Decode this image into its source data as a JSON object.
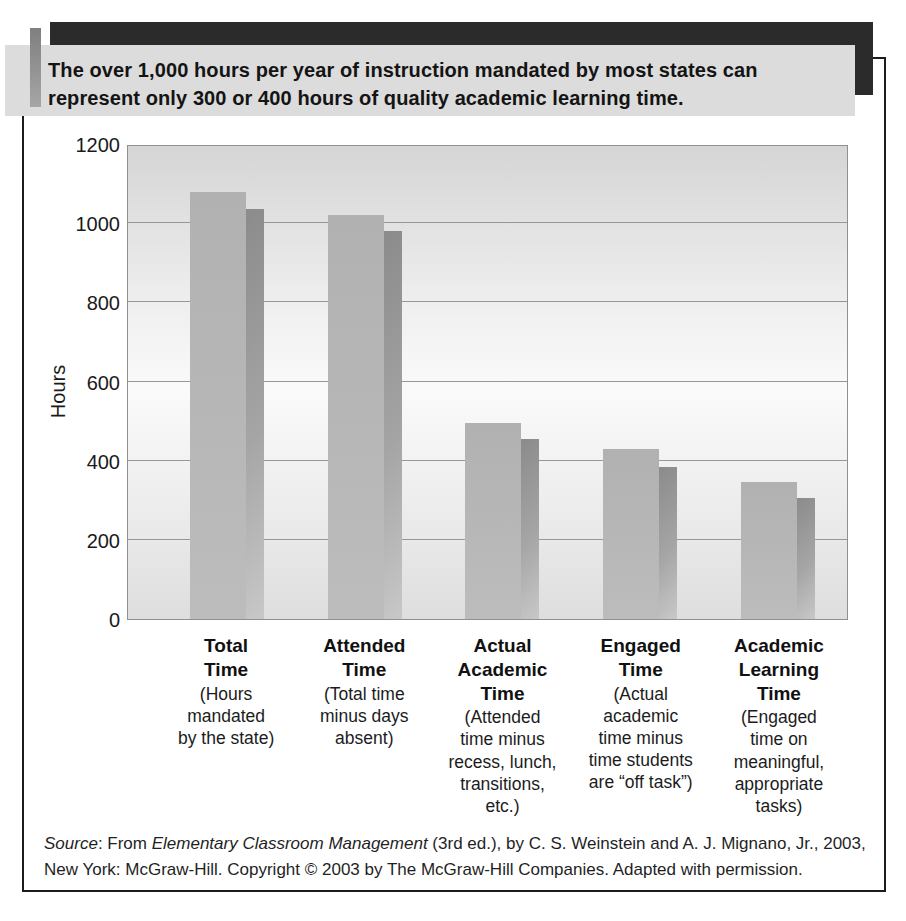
{
  "header": {
    "caption": "The over 1,000 hours per year of instruction mandated by most states can\nrepresent only 300 or 400 hours of quality academic learning time."
  },
  "chart_data": {
    "type": "bar",
    "title": "",
    "xlabel": "",
    "ylabel": "Hours",
    "ylim": [
      0,
      1200
    ],
    "yticks": [
      0,
      200,
      400,
      600,
      800,
      1000,
      1200
    ],
    "grid": true,
    "legend": false,
    "categories": [
      "Total Time",
      "Attended Time",
      "Actual Academic Time",
      "Engaged Time",
      "Academic Learning Time"
    ],
    "values": [
      1080,
      1020,
      495,
      430,
      345
    ],
    "shadow_values": [
      1035,
      980,
      455,
      385,
      305
    ],
    "x_labels": [
      {
        "title": "Total\nTime",
        "desc": "(Hours\nmandated\nby the state)"
      },
      {
        "title": "Attended\nTime",
        "desc": "(Total time\nminus days\nabsent)"
      },
      {
        "title": "Actual\nAcademic\nTime",
        "desc": "(Attended\ntime minus\nrecess, lunch,\ntransitions,\netc.)"
      },
      {
        "title": "Engaged\nTime",
        "desc": "(Actual\nacademic\ntime minus\ntime students\nare “off task”)"
      },
      {
        "title": "Academic\nLearning\nTime",
        "desc": "(Engaged\ntime on\nmeaningful,\nappropriate\ntasks)"
      }
    ],
    "colors": {
      "bar": "#b1b1b1",
      "bar_shadow_start": "#8b8b8b",
      "bar_shadow_end": "#c8c8c8",
      "plot_bg_top": "#d5d5d5",
      "plot_bg_mid": "#fafafa",
      "plot_bg_bottom": "#dedede",
      "gridline": "#979797"
    }
  },
  "decor": {
    "caption_bg": "#dcdcdc",
    "top_bar": "#2b2b2b",
    "accent_stripe": "#9a9a9a",
    "frame_border": "#1c1c1c"
  },
  "source": {
    "label_italic": "Source",
    "mid": ": From ",
    "book_italic": "Elementary Classroom Management",
    "rest": " (3rd ed.), by C. S. Weinstein and A. J. Mignano, Jr., 2003, New York: McGraw-Hill. Copyright © 2003 by The McGraw-Hill Companies. Adapted with permission."
  }
}
